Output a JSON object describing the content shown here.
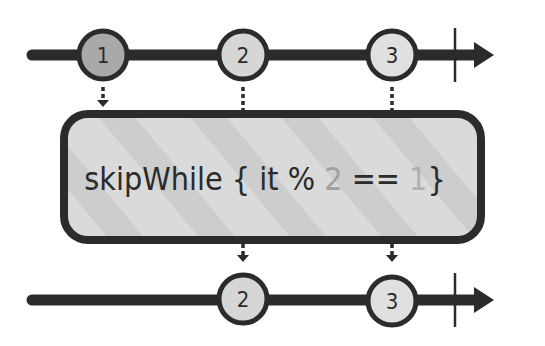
{
  "diagram": {
    "type": "marble-diagram",
    "operator_label": "skipWhile { it % 2 == 1}",
    "operator_parts": {
      "name": "skipWhile",
      "open_brace": "{",
      "body_prefix": "it %",
      "mod_value": "2",
      "equals": "==",
      "compare_value": "1",
      "close_brace": "}"
    },
    "input_stream": {
      "marbles": [
        {
          "label": "1",
          "fill": "#a9a9a9",
          "skipped": true
        },
        {
          "label": "2",
          "fill": "#d6d6d6",
          "skipped": false
        },
        {
          "label": "3",
          "fill": "#e0e0e0",
          "skipped": false
        }
      ],
      "completes": true
    },
    "output_stream": {
      "marbles": [
        {
          "label": "2",
          "fill": "#d6d6d6"
        },
        {
          "label": "3",
          "fill": "#e0e0e0"
        }
      ],
      "completes": true
    },
    "colors": {
      "line": "#2b2b2b",
      "box_fill": "#d9d9d9",
      "box_stripe": "#cbcbcb",
      "text": "#2b2b2b",
      "highlight_text": "#a0a0a0"
    }
  }
}
